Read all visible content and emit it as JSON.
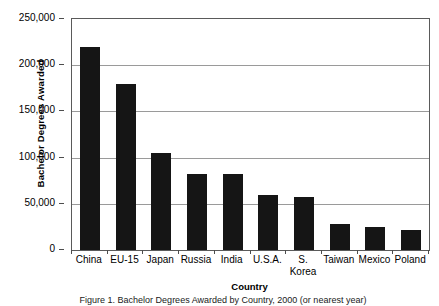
{
  "chart_data": {
    "type": "bar",
    "title": "",
    "xlabel": "Country",
    "ylabel": "Bachelor Degrees Awarded",
    "categories": [
      "China",
      "EU-15",
      "Japan",
      "Russia",
      "India",
      "U.S.A.",
      "S.\nKorea",
      "Taiwan",
      "Mexico",
      "Poland"
    ],
    "values": [
      220000,
      180000,
      105000,
      82000,
      82000,
      60000,
      57000,
      28000,
      25000,
      22000
    ],
    "ylim": [
      0,
      250000
    ],
    "yticks": [
      0,
      50000,
      100000,
      150000,
      200000,
      250000
    ],
    "ytick_labels": [
      "0",
      "50,000",
      "100,000",
      "150,000",
      "200,000",
      "250,000"
    ],
    "grid": true,
    "legend": false,
    "bar_color": "#151515",
    "gridline_color": "#9a9a9a",
    "frame_color": "#5a5a5a",
    "background_color": "#ffffff"
  },
  "caption": {
    "text": "Figure 1. Bachelor Degrees Awarded by Country, 2000 (or nearest year)"
  }
}
